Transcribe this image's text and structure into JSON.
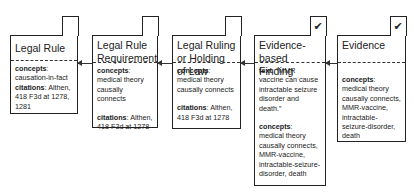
{
  "nodes": [
    {
      "title": "Legal Rule",
      "checked": false,
      "concepts_label": "concepts",
      "concepts": "causation-in-fact",
      "citations_label": "citations",
      "citations": "Althen, 418 F3d at 1278, 1281"
    },
    {
      "title": "Legal Rule Requirement",
      "checked": false,
      "concepts_label": "concepts",
      "concepts": "medical theory causally connects",
      "citations_label": "citations",
      "citations": "Althen, 418 F3d at 1278"
    },
    {
      "title": "Legal Ruling or Holding of Law",
      "checked": false,
      "concepts_label": "concepts",
      "concepts": "medical theory causally connects",
      "citations_label": "citations",
      "citations": "Althen, 418 F3d at 1278"
    },
    {
      "title": "Evidence-based Finding",
      "checked": true,
      "text_label": "text",
      "text": "“MMR vaccine can cause intractable seizure disorder and death.”",
      "concepts_label": "concepts",
      "concepts": "medical theory causally connects, MMR-vaccine, intractable-seizure-disorder, death"
    },
    {
      "title": "Evidence",
      "checked": true,
      "concepts_label": "concepts",
      "concepts": "medical theory causally connects, MMR-vaccine, intractable-seizure-disorder, death"
    }
  ],
  "check_glyph": "✔",
  "edges": [
    {
      "from": "Legal Rule Requirement",
      "to": "Legal Rule"
    },
    {
      "from": "Legal Ruling or Holding of Law",
      "to": "Legal Rule Requirement"
    },
    {
      "from": "Evidence-based Finding",
      "to": "Legal Ruling or Holding of Law"
    },
    {
      "from": "Evidence",
      "to": "Evidence-based Finding"
    }
  ]
}
